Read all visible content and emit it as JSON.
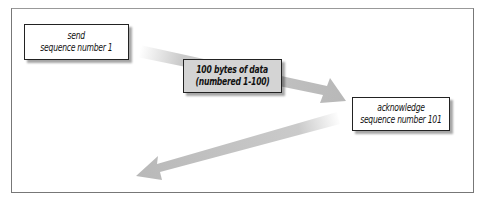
{
  "diagram": {
    "type": "tcp-sequence-acknowledgment",
    "nodes": [
      {
        "id": "send",
        "lines": [
          "send",
          "sequence number 1"
        ],
        "fill": "#ffffff"
      },
      {
        "id": "data",
        "lines": [
          "100 bytes of data",
          "(numbered 1-100)"
        ],
        "fill": "#d4d4d4"
      },
      {
        "id": "ack",
        "lines": [
          "acknowledge",
          "sequence number 101"
        ],
        "fill": "#ffffff"
      }
    ],
    "edges": [
      {
        "from": "send",
        "to": "ack",
        "via": "data",
        "direction": "right-down"
      },
      {
        "from": "ack",
        "to": "send-side",
        "direction": "left-down"
      }
    ],
    "colors": {
      "arrow": "#bdbdbd",
      "frame": "#777777",
      "box_border": "#222222"
    }
  }
}
